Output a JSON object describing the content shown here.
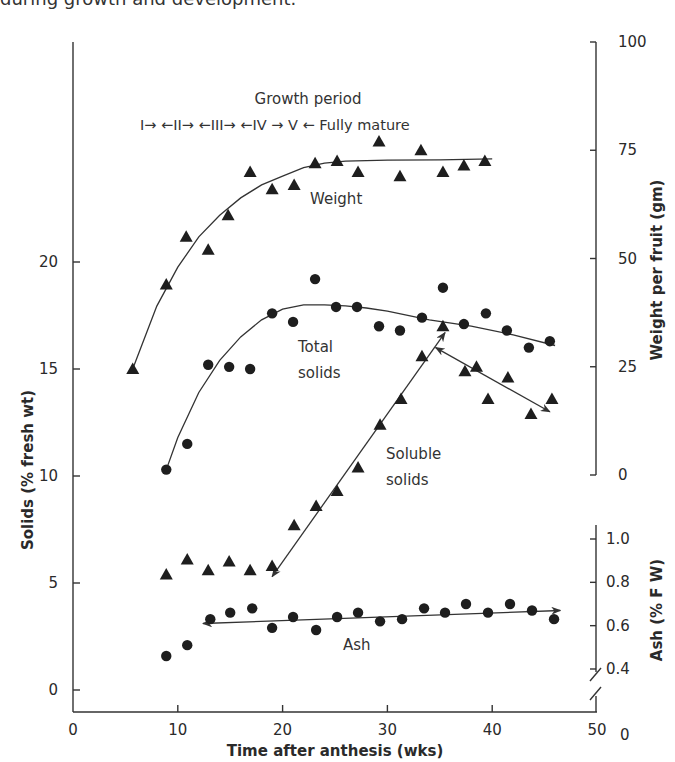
{
  "caption": "during growth and development.",
  "chart_data": {
    "type": "scatter",
    "title": "",
    "xlabel": "Time after anthesis (wks)",
    "ylabel_left": "Solids (% fresh wt)",
    "ylabel_right_top": "Weight per fruit (gm)",
    "ylabel_right_bottom": "Ash (% F W)",
    "xlim": [
      0,
      50
    ],
    "x_ticks": [
      0,
      10,
      20,
      30,
      40,
      50
    ],
    "ylim_left": [
      0,
      25
    ],
    "y_ticks_left": [
      0,
      5,
      10,
      15,
      20
    ],
    "ylim_weight": [
      0,
      100
    ],
    "y_ticks_weight": [
      0,
      25,
      50,
      75,
      100
    ],
    "y_ticks_ash": [
      "0",
      "0.4",
      "0.6",
      "0.8",
      "1.0"
    ],
    "grid": false,
    "annotations": {
      "growth_period_title": "Growth period",
      "growth_period_stages": "I→  ←II→ ←III→  ←IV → V ←  Fully mature",
      "weight_label": "Weight",
      "total_solids_label_1": "Total",
      "total_solids_label_2": "solids",
      "soluble_solids_label_1": "Soluble",
      "soluble_solids_label_2": "solids",
      "ash_label": "Ash"
    },
    "series": [
      {
        "name": "Weight",
        "axis": "weight (gm)",
        "marker": "triangle",
        "x": [
          5.7,
          8.9,
          10.8,
          12.9,
          14.8,
          16.9,
          19.0,
          21.1,
          23.1,
          25.2,
          27.2,
          29.2,
          31.2,
          33.2,
          35.3,
          37.3,
          39.3
        ],
        "y": [
          24.5,
          44,
          55,
          52,
          60,
          70,
          66,
          67,
          72,
          72.5,
          70,
          77,
          69,
          75,
          70,
          71.5,
          72.5
        ]
      },
      {
        "name": "Total solids",
        "axis": "solids (% fresh wt)",
        "marker": "circle",
        "x": [
          8.9,
          10.9,
          12.9,
          14.9,
          16.9,
          19.0,
          21.0,
          23.1,
          25.1,
          27.1,
          29.2,
          31.2,
          33.3,
          35.3,
          37.3,
          39.4,
          41.4,
          43.5,
          45.5
        ],
        "y": [
          10.3,
          11.5,
          15.2,
          15.1,
          15.0,
          17.6,
          17.2,
          19.2,
          17.9,
          17.9,
          17.0,
          16.8,
          17.4,
          18.8,
          17.1,
          17.6,
          16.8,
          16.0,
          16.3
        ]
      },
      {
        "name": "Soluble solids",
        "axis": "solids (% fresh wt)",
        "marker": "triangle",
        "x": [
          8.9,
          10.9,
          12.9,
          14.9,
          16.9,
          19.0,
          21.1,
          23.2,
          25.2,
          27.2,
          29.3,
          31.3,
          33.3,
          35.3,
          37.4,
          38.5,
          39.6,
          41.5,
          43.7,
          45.7
        ],
        "y": [
          5.4,
          6.1,
          5.6,
          6.0,
          5.6,
          5.8,
          7.7,
          8.6,
          9.3,
          10.4,
          12.4,
          13.6,
          15.6,
          17.0,
          14.9,
          15.1,
          13.6,
          14.6,
          12.9,
          13.6
        ]
      },
      {
        "name": "Ash",
        "axis": "ash (% F W)",
        "marker": "circle",
        "x": [
          8.9,
          10.9,
          13.1,
          15.0,
          17.1,
          19.0,
          21.0,
          23.2,
          25.2,
          27.2,
          29.3,
          31.4,
          33.5,
          35.5,
          37.5,
          39.6,
          41.7,
          43.8,
          45.9
        ],
        "y": [
          0.46,
          0.51,
          0.63,
          0.66,
          0.68,
          0.59,
          0.64,
          0.58,
          0.64,
          0.66,
          0.62,
          0.63,
          0.68,
          0.66,
          0.7,
          0.66,
          0.7,
          0.67,
          0.63
        ]
      }
    ],
    "trend_lines": {
      "weight_curve": {
        "x": [
          5.7,
          8,
          10,
          12,
          14,
          16,
          18,
          20,
          22,
          24,
          26,
          30,
          35,
          40
        ],
        "y": [
          24.5,
          39,
          48,
          55,
          60,
          64,
          67,
          69,
          71,
          72,
          72.5,
          72.7,
          72.8,
          73
        ]
      },
      "total_solids_curve": {
        "x": [
          8.9,
          10,
          12,
          14,
          16,
          18,
          20,
          22,
          24,
          26,
          28,
          30,
          34,
          38,
          42,
          46
        ],
        "y": [
          10.3,
          11.8,
          13.9,
          15.4,
          16.5,
          17.3,
          17.8,
          18.0,
          18.0,
          17.95,
          17.85,
          17.7,
          17.3,
          17.0,
          16.6,
          16.1
        ]
      },
      "soluble_rise_arrow": {
        "x": [
          19.0,
          35.5
        ],
        "y": [
          5.3,
          16.7
        ]
      },
      "soluble_fall_arrow": {
        "x": [
          34.6,
          45.5
        ],
        "y": [
          16.0,
          13.0
        ]
      },
      "ash_arrow": {
        "x": [
          12.4,
          46.5
        ],
        "y": [
          0.61,
          0.67
        ]
      }
    }
  }
}
